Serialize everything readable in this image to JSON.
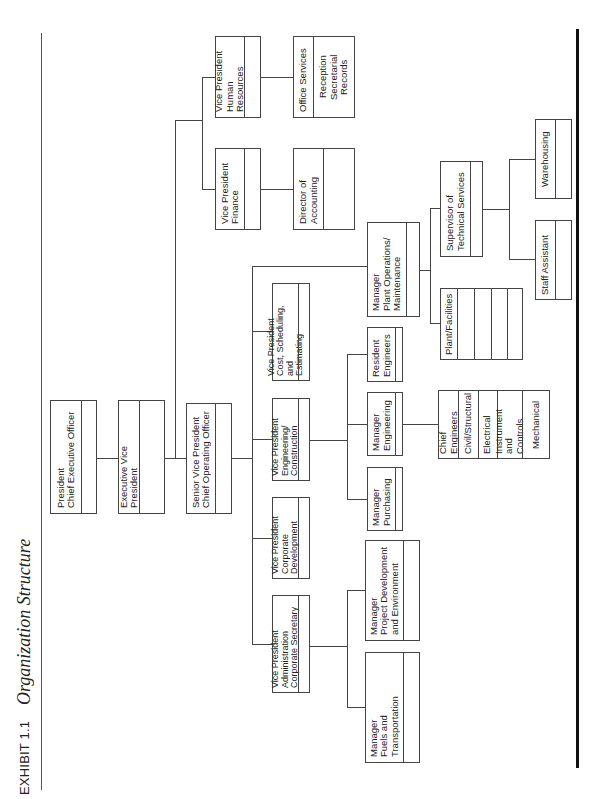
{
  "exhibit": {
    "number": "EXHIBIT 1.1",
    "title": "Organization Structure"
  },
  "org": {
    "president": {
      "label": "President\nChief Executive Officer"
    },
    "executive_vp": {
      "label": "Executive Vice President"
    },
    "senior_vp": {
      "label": "Senior Vice President\nChief Operating Officer"
    },
    "vp_administration": {
      "label": "Vice President\nAdministration\nCorporate Secretary"
    },
    "vp_corporate_development": {
      "label": "Vice President\nCorporate\nDevelopment"
    },
    "vp_engineering_construction": {
      "label": "Vice President\nEngineering/\nConstruction"
    },
    "vp_cost_scheduling": {
      "label": "Vice President\nCost, Scheduling, and\nEstimating"
    },
    "vp_finance": {
      "label": "Vice President\nFinance"
    },
    "vp_human_resources": {
      "label": "Vice President\nHuman Resources"
    },
    "director_accounting": {
      "label": "Director of\nAccounting"
    },
    "office_services": {
      "label": "Office Services",
      "sub": "Reception\nSecretarial\nRecords"
    },
    "mgr_fuels": {
      "label": "Manager\nFuels and Transportation"
    },
    "mgr_project_development": {
      "label": "Manager\nProject Development\nand Environment"
    },
    "mgr_purchasing": {
      "label": "Manager\nPurchasing"
    },
    "mgr_engineering": {
      "label": "Manager\nEngineering"
    },
    "resident_engineers": {
      "label": "Resident\nEngineers"
    },
    "mgr_plant_operations": {
      "label": "Manager\nPlant Operations/\nMaintenance"
    },
    "chief_engineers": {
      "label": "Chief Engineers",
      "rows": [
        "Civil/Structural",
        "Electrical",
        "Instrument and\nControls",
        "Mechanical"
      ]
    },
    "plant_facilities": {
      "label": "Plant/Facilities"
    },
    "supervisor_technical": {
      "label": "Supervisor of\nTechnical Services"
    },
    "staff_assistant": {
      "label": "Staff   Assistant"
    },
    "warehousing": {
      "label": "Warehousing"
    }
  }
}
